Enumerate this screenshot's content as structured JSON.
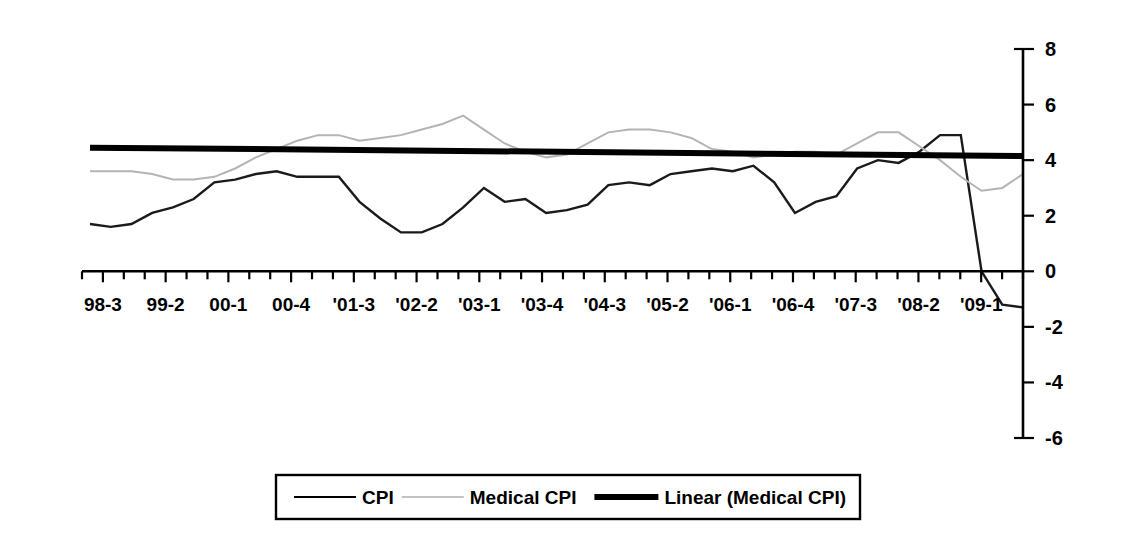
{
  "chart_data": {
    "type": "line",
    "title": "",
    "subtitle": "",
    "xlabel": "",
    "ylabel": "",
    "grid": false,
    "legend_position": "bottom",
    "ylim": [
      -6,
      8
    ],
    "ytick_labels": [
      "8",
      "6",
      "4",
      "2",
      "0",
      "-2",
      "-4",
      "-6"
    ],
    "ytick_values": [
      8,
      6,
      4,
      2,
      0,
      -2,
      -4,
      -6
    ],
    "y_axis_side": "right",
    "xtick_labels": [
      "98-3",
      "99-2",
      "00-1",
      "00-4",
      "'01-3",
      "'02-2",
      "'03-1",
      "'03-4",
      "'04-3",
      "'05-2",
      "'06-1",
      "'06-4",
      "'07-3",
      "'08-2",
      "'09-1"
    ],
    "x_tick_count": 46,
    "x_label_every": 3,
    "x_label_offset": 1,
    "categories": [
      "98-3",
      "98-4",
      "99-1",
      "99-2",
      "99-3",
      "99-4",
      "00-1",
      "00-2",
      "00-3",
      "00-4",
      "'01-1",
      "'01-2",
      "'01-3",
      "'01-4",
      "'02-1",
      "'02-2",
      "'02-3",
      "'02-4",
      "'03-1",
      "'03-2",
      "'03-3",
      "'03-4",
      "'04-1",
      "'04-2",
      "'04-3",
      "'04-4",
      "'05-1",
      "'05-2",
      "'05-3",
      "'05-4",
      "'06-1",
      "'06-2",
      "'06-3",
      "'06-4",
      "'07-1",
      "'07-2",
      "'07-3",
      "'07-4",
      "'08-1",
      "'08-2",
      "'08-3",
      "'08-4",
      "'09-1",
      "'09-2",
      "'09-3",
      "'09-4"
    ],
    "series": [
      {
        "name": "CPI",
        "color": "#1a1a1a",
        "style": "thin-line",
        "values": [
          1.7,
          1.6,
          1.7,
          2.1,
          2.3,
          2.6,
          3.2,
          3.3,
          3.5,
          3.6,
          3.4,
          3.4,
          3.4,
          2.5,
          1.9,
          1.4,
          1.4,
          1.7,
          2.3,
          3.0,
          2.5,
          2.6,
          2.1,
          2.2,
          2.4,
          3.1,
          3.2,
          3.1,
          3.5,
          3.6,
          3.7,
          3.6,
          3.8,
          3.2,
          2.1,
          2.5,
          2.7,
          3.7,
          4.0,
          3.9,
          4.3,
          4.9,
          4.9,
          0.0,
          -1.2,
          -1.3
        ]
      },
      {
        "name": "Medical CPI",
        "color": "#b4b4b4",
        "style": "thin-light-line",
        "values": [
          3.6,
          3.6,
          3.6,
          3.5,
          3.3,
          3.3,
          3.4,
          3.7,
          4.1,
          4.4,
          4.7,
          4.9,
          4.9,
          4.7,
          4.8,
          4.9,
          5.1,
          5.3,
          5.6,
          5.1,
          4.6,
          4.3,
          4.1,
          4.2,
          4.6,
          5.0,
          5.1,
          5.1,
          5.0,
          4.8,
          4.4,
          4.3,
          4.1,
          4.2,
          4.3,
          4.3,
          4.2,
          4.6,
          5.0,
          5.0,
          4.5,
          4.0,
          3.4,
          2.9,
          3.0,
          3.5
        ]
      }
    ],
    "trendline": {
      "name": "Linear (Medical CPI)",
      "color": "#000000",
      "style": "thick-line",
      "start_value": 4.45,
      "end_value": 4.15
    },
    "annotations": []
  },
  "legend": {
    "entries": [
      {
        "label": "CPI",
        "swatch": "thin-dark-line"
      },
      {
        "label": "Medical CPI",
        "swatch": "thin-light-line"
      },
      {
        "label": "Linear (Medical CPI)",
        "swatch": "thick-black-line"
      }
    ]
  }
}
